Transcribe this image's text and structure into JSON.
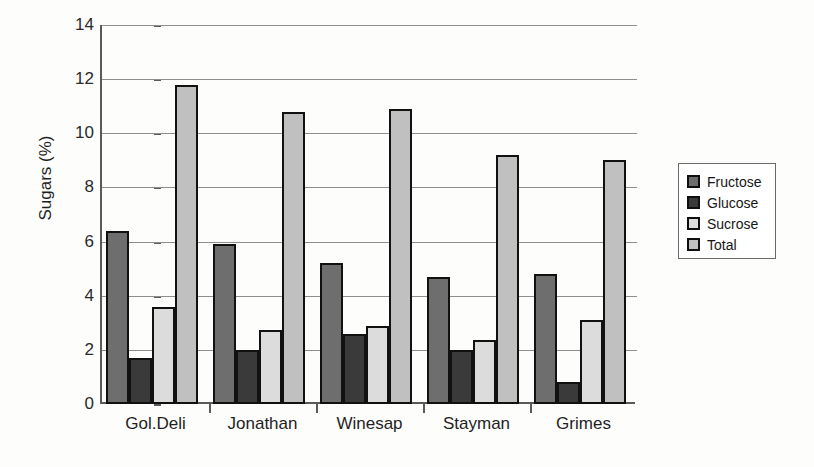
{
  "chart_data": {
    "type": "bar",
    "title": "",
    "xlabel": "",
    "ylabel": "Sugars (%)",
    "ylim": [
      0,
      14
    ],
    "ytick_step": 2,
    "yticks": [
      "0",
      "2",
      "4",
      "6",
      "8",
      "10",
      "12",
      "14"
    ],
    "grid": true,
    "legend_position": "right",
    "categories": [
      "Gol.Deli",
      "Jonathan",
      "Winesap",
      "Stayman",
      "Grimes"
    ],
    "series": [
      {
        "name": "Fructose",
        "color": "#6e6e6e",
        "values": [
          6.4,
          5.9,
          5.2,
          4.7,
          4.8
        ]
      },
      {
        "name": "Glucose",
        "color": "#3a3a3a",
        "values": [
          1.7,
          2.0,
          2.6,
          2.0,
          0.8
        ]
      },
      {
        "name": "Sucrose",
        "color": "#dcdcdc",
        "values": [
          3.6,
          2.75,
          2.9,
          2.35,
          3.1
        ]
      },
      {
        "name": "Total",
        "color": "#c0c0c0",
        "values": [
          11.8,
          10.8,
          10.9,
          9.2,
          9.0
        ]
      }
    ]
  },
  "legend": {
    "items": [
      {
        "label": "Fructose"
      },
      {
        "label": "Glucose"
      },
      {
        "label": "Sucrose"
      },
      {
        "label": "Total"
      }
    ]
  },
  "scan_artifacts": {
    "ghost1": "",
    "ghost2": "",
    "ghost3": "",
    "ghost4": ""
  }
}
